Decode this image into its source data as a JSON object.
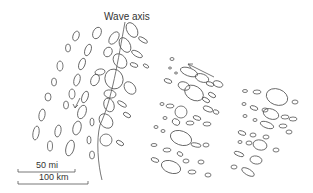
{
  "diagram": {
    "axis_label": "Wave axis",
    "scale_bar_miles": "50 mi",
    "scale_bar_km": "100 km",
    "line_color": "#555555",
    "icons": [
      "wind-direction-arrow",
      "motion-arrow"
    ]
  }
}
